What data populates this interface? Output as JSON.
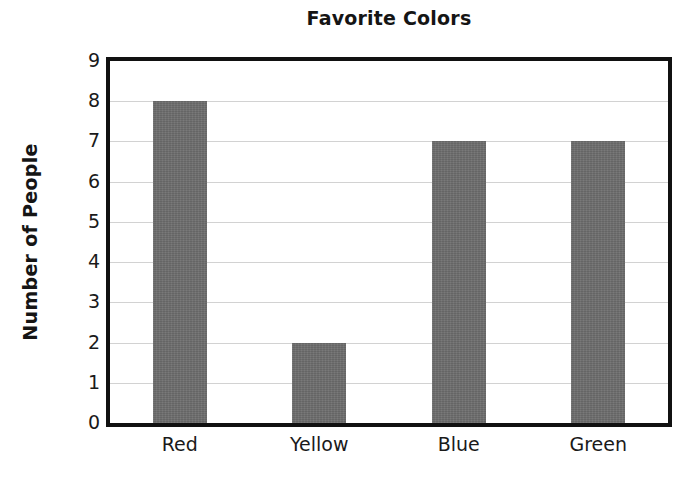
{
  "chart_data": {
    "type": "bar",
    "title": "Favorite Colors",
    "xlabel": "",
    "ylabel": "Number of People",
    "categories": [
      "Red",
      "Yellow",
      "Blue",
      "Green"
    ],
    "values": [
      8,
      2,
      7,
      7
    ],
    "ylim": [
      0,
      9
    ],
    "ytick_step": 1,
    "yticks": [
      9,
      8,
      7,
      6,
      5,
      4,
      3,
      2,
      1,
      0
    ],
    "grid": true,
    "grid_axis": "y",
    "legend": false,
    "legend_position": "none",
    "bar_color": "#6e6e6e",
    "grid_color": "#d2d2d2",
    "axis_color": "#111111",
    "background_color": "#ffffff",
    "text_color": "#1a1a1a"
  }
}
